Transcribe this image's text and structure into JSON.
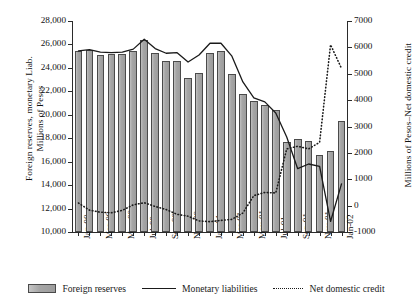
{
  "chart_data": {
    "type": "bar",
    "title": "",
    "xlabel": "",
    "ylabel": "Foreign reserves, monetary Liab. Millions of Pesos",
    "y2label": "Millions of Pesos–Net domestic credit",
    "ylim": [
      10000,
      28000
    ],
    "y2lim": [
      -1000,
      7000
    ],
    "yticks": [
      "10,000",
      "12,000",
      "14,000",
      "16,000",
      "18,000",
      "20,000",
      "22,000",
      "24,000",
      "26,000",
      "28,000"
    ],
    "ytick_values": [
      10000,
      12000,
      14000,
      16000,
      18000,
      20000,
      22000,
      24000,
      26000,
      28000
    ],
    "y2ticks": [
      "-1000",
      "0",
      "1000",
      "2000",
      "3000",
      "4000",
      "5000",
      "6000",
      "7000"
    ],
    "y2tick_values": [
      -1000,
      0,
      1000,
      2000,
      3000,
      4000,
      5000,
      6000,
      7000
    ],
    "grid": false,
    "legend_position": "bottom",
    "x": [
      "Jan-00",
      "Feb-00",
      "Mar-00",
      "Apr-00",
      "May-00",
      "Jun-00",
      "Jul-00",
      "Aug-00",
      "Sep-00",
      "Oct-00",
      "Nov-00",
      "Dec-00",
      "Jan-01",
      "Feb-01",
      "Mar-01",
      "Apr-01",
      "May-01",
      "Jun-01",
      "Jul-01",
      "Aug-01",
      "Sep-01",
      "Oct-01",
      "Nov-01",
      "Dec-01",
      "Jan-02"
    ],
    "xtick_labels": [
      "Jan-00",
      "Mar-00",
      "May-00",
      "Jul-00",
      "Sep-00",
      "Nov-00",
      "Jan-01",
      "Mar-01",
      "May-01",
      "Jul-01",
      "Sep-01",
      "Nov-01",
      "Jan-02"
    ],
    "xtick_indices": [
      0,
      2,
      4,
      6,
      8,
      10,
      12,
      14,
      16,
      18,
      20,
      22,
      24
    ],
    "series": [
      {
        "name": "Foreign reserves",
        "type": "bar",
        "axis": "left",
        "color": "#a6a6a6",
        "values": [
          25450,
          25500,
          25100,
          25200,
          25200,
          25450,
          26400,
          25300,
          24600,
          24600,
          23150,
          23600,
          25300,
          25400,
          23500,
          21750,
          21150,
          20800,
          20400,
          17650,
          17950,
          17800,
          16550,
          16900,
          19500
        ]
      },
      {
        "name": "Monetary liabilities",
        "type": "line",
        "style": "solid",
        "axis": "left",
        "color": "#1a1a1a",
        "values": [
          25450,
          25550,
          25350,
          25300,
          25350,
          25600,
          26450,
          25650,
          25250,
          25300,
          24500,
          25100,
          26100,
          26100,
          25000,
          22800,
          21450,
          21100,
          20150,
          18100,
          15400,
          15800,
          15600,
          10900,
          14100
        ]
      },
      {
        "name": "Net domestic credit",
        "type": "line",
        "style": "dotted",
        "axis": "right",
        "color": "#1a1a1a",
        "values": [
          100,
          -170,
          -250,
          -270,
          -180,
          30,
          110,
          -30,
          -150,
          -330,
          -400,
          -580,
          -610,
          -560,
          -520,
          -280,
          380,
          500,
          480,
          2150,
          2250,
          2150,
          2400,
          6100,
          5200
        ]
      }
    ]
  },
  "legend": {
    "items": [
      {
        "label": "Foreign reserves",
        "marker": "bar-swatch"
      },
      {
        "label": "Monetary liabilities",
        "marker": "solid-line"
      },
      {
        "label": "Net domestic credit",
        "marker": "dotted-line"
      }
    ]
  },
  "axis_titles": {
    "left_line1": "Foreign reserves, monetary Liab.",
    "left_line2": "Millions of Pesos",
    "right": "Millions of Pesos–Net domestic credit"
  }
}
